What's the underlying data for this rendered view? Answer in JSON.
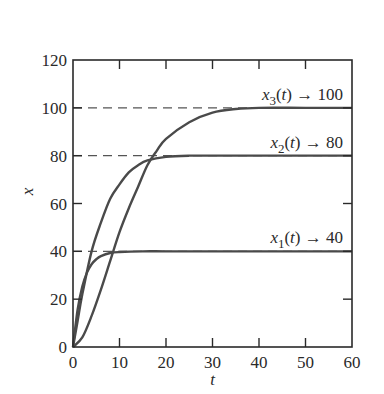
{
  "chart_data": {
    "type": "line",
    "title": "",
    "xlabel": "t",
    "ylabel": "x",
    "xlim": [
      0,
      60
    ],
    "ylim": [
      0,
      120
    ],
    "xticks": [
      0,
      10,
      20,
      30,
      40,
      50,
      60
    ],
    "yticks": [
      0,
      20,
      40,
      60,
      80,
      100,
      120
    ],
    "grid": false,
    "legend": "none (inline annotations)",
    "series": [
      {
        "name": "x1(t)",
        "limit": 40,
        "annotation": {
          "var": "x",
          "sub": "1",
          "arg": "(t)",
          "arrow": "→",
          "value": "40"
        },
        "x": [
          0,
          1,
          2,
          3,
          4,
          5,
          6,
          8,
          10,
          15,
          20,
          30,
          40,
          50,
          60
        ],
        "y": [
          0,
          15.7,
          25.3,
          31.1,
          34.6,
          36.7,
          38.0,
          39.3,
          39.7,
          40,
          40,
          40,
          40,
          40,
          40
        ]
      },
      {
        "name": "x2(t)",
        "limit": 80,
        "annotation": {
          "var": "x",
          "sub": "2",
          "arg": "(t)",
          "arrow": "→",
          "value": "80"
        },
        "x": [
          0,
          1,
          2,
          4,
          6,
          8,
          10,
          12,
          14,
          16,
          20,
          25,
          30,
          40,
          50,
          60
        ],
        "y": [
          0,
          11,
          22,
          40,
          52,
          62,
          68,
          73,
          76,
          78,
          79.5,
          80,
          80,
          80,
          80,
          80
        ]
      },
      {
        "name": "x3(t)",
        "limit": 100,
        "annotation": {
          "var": "x",
          "sub": "3",
          "arg": "(t)",
          "arrow": "→",
          "value": "100"
        },
        "x": [
          0,
          2,
          4,
          6,
          8,
          10,
          12,
          14,
          16,
          18,
          20,
          25,
          30,
          35,
          40,
          50,
          60
        ],
        "y": [
          0,
          4,
          13,
          24,
          36,
          48,
          58,
          67,
          76,
          82,
          87,
          94,
          98,
          99.5,
          100,
          100,
          100
        ]
      }
    ],
    "reference_lines": [
      {
        "y": 40,
        "style": "dashed"
      },
      {
        "y": 80,
        "style": "dashed"
      },
      {
        "y": 100,
        "style": "dashed"
      }
    ]
  },
  "colors": {
    "curve": "#4a4a4a",
    "axis": "#2a2a2a",
    "dashed": "#555555"
  }
}
